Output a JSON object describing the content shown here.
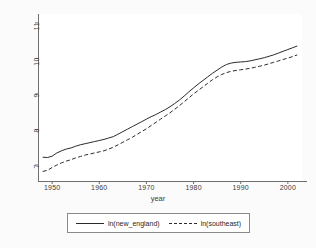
{
  "chart_data": {
    "type": "line",
    "title": "",
    "xlabel": "year",
    "ylabel": "",
    "xlim": [
      1947,
      2003
    ],
    "ylim": [
      6.55,
      11.25
    ],
    "grid": false,
    "legend_position": "bottom",
    "xticks": [
      1950,
      1960,
      1970,
      1980,
      1990,
      2000
    ],
    "xtick_labels": [
      "1950",
      "1960",
      "1970",
      "1980",
      "1990",
      "2000"
    ],
    "yticks": [
      7,
      8,
      9,
      10,
      11
    ],
    "ytick_labels": [
      "7",
      "8",
      "9",
      "10",
      "11"
    ],
    "x": [
      1948,
      1949,
      1950,
      1951,
      1952,
      1953,
      1954,
      1955,
      1956,
      1957,
      1958,
      1959,
      1960,
      1961,
      1962,
      1963,
      1964,
      1965,
      1966,
      1967,
      1968,
      1969,
      1970,
      1971,
      1972,
      1973,
      1974,
      1975,
      1976,
      1977,
      1978,
      1979,
      1980,
      1981,
      1982,
      1983,
      1984,
      1985,
      1986,
      1987,
      1988,
      1989,
      1990,
      1991,
      1992,
      1993,
      1994,
      1995,
      1996,
      1997,
      1998,
      1999,
      2000,
      2001,
      2002
    ],
    "series": [
      {
        "name": "ln(new_england)",
        "style": "solid",
        "color": "#2b2b2b",
        "values": [
          7.22,
          7.21,
          7.25,
          7.34,
          7.4,
          7.45,
          7.48,
          7.53,
          7.57,
          7.6,
          7.63,
          7.66,
          7.69,
          7.72,
          7.76,
          7.8,
          7.87,
          7.94,
          8.01,
          8.08,
          8.15,
          8.22,
          8.29,
          8.36,
          8.42,
          8.49,
          8.56,
          8.64,
          8.73,
          8.83,
          8.94,
          9.06,
          9.17,
          9.28,
          9.38,
          9.48,
          9.58,
          9.67,
          9.76,
          9.83,
          9.87,
          9.89,
          9.9,
          9.91,
          9.93,
          9.96,
          9.99,
          10.02,
          10.06,
          10.1,
          10.15,
          10.2,
          10.25,
          10.3,
          10.35
        ]
      },
      {
        "name": "ln(southeast)",
        "style": "dashed",
        "color": "#2b2b2b",
        "values": [
          6.82,
          6.85,
          6.93,
          7.0,
          7.06,
          7.11,
          7.15,
          7.2,
          7.24,
          7.28,
          7.31,
          7.34,
          7.37,
          7.4,
          7.45,
          7.5,
          7.57,
          7.64,
          7.71,
          7.78,
          7.86,
          7.94,
          8.02,
          8.11,
          8.2,
          8.29,
          8.38,
          8.47,
          8.57,
          8.67,
          8.78,
          8.89,
          9.0,
          9.1,
          9.2,
          9.3,
          9.4,
          9.48,
          9.55,
          9.6,
          9.64,
          9.66,
          9.68,
          9.7,
          9.72,
          9.75,
          9.78,
          9.81,
          9.85,
          9.89,
          9.93,
          9.97,
          10.01,
          10.05,
          10.1
        ]
      }
    ]
  },
  "axes": {
    "x_title": "year"
  },
  "legend": {
    "entries": [
      {
        "label": "ln(new_england)",
        "style": "solid"
      },
      {
        "label": "ln(southeast)",
        "style": "dashed"
      }
    ]
  }
}
